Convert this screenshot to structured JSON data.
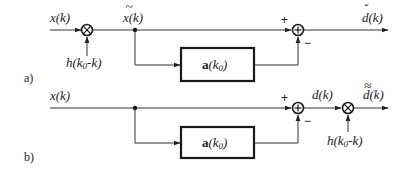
{
  "diagram_a": {
    "tag": "a)",
    "input_label": "x(k)",
    "multiplier_symbol": "⊗",
    "window_label": "h(k",
    "window_sub": "0",
    "window_tail": "-k)",
    "windowed_label": "x(k)",
    "windowed_mark": "~",
    "block_bold": "a",
    "block_rest": "(k",
    "block_sub": "0",
    "block_close": ")",
    "sum_symbol": "⊕",
    "plus_sign": "+",
    "minus_sign": "−",
    "output_label": "d(k)",
    "output_mark": "ˇ"
  },
  "diagram_b": {
    "tag": "b)",
    "input_label": "x(k)",
    "block_bold": "a",
    "block_rest": "(k",
    "block_sub": "0",
    "block_close": ")",
    "sum_symbol": "⊕",
    "plus_sign": "+",
    "minus_sign": "−",
    "error_label": "d(k)",
    "multiplier_symbol": "⊗",
    "window_label": "h(k",
    "window_sub": "0",
    "window_tail": "-k)",
    "output_label": "d(k)",
    "output_mark": "≈"
  },
  "colors": {
    "line": "#333333",
    "text": "#1a1a1a",
    "background": "#ffffff"
  }
}
